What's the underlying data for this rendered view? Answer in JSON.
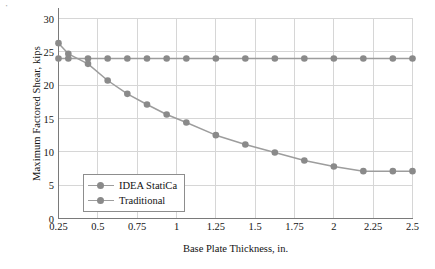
{
  "figure": {
    "corner_mark": "⋅"
  },
  "chart_data": {
    "type": "line",
    "title": "",
    "xlabel": "Base Plate Thickness, in.",
    "ylabel": "Maximum Factored Shear, kips",
    "xlim": [
      0.25,
      2.5
    ],
    "ylim": [
      0,
      30
    ],
    "xticks": [
      "0.25",
      "0.5",
      "0.75",
      "1",
      "1.25",
      "1.5",
      "1.75",
      "2",
      "2.25",
      "2.5"
    ],
    "xtick_values": [
      0.25,
      0.5,
      0.75,
      1,
      1.25,
      1.5,
      1.75,
      2,
      2.25,
      2.5
    ],
    "yticks": [
      "0",
      "5",
      "10",
      "15",
      "20",
      "25",
      "30"
    ],
    "ytick_values": [
      0,
      5,
      10,
      15,
      20,
      25,
      30
    ],
    "grid": true,
    "legend_position": "lower left",
    "marker": "circle",
    "line_color": "#9d9d9d",
    "marker_color": "#8a8a8a",
    "grid_color": "#d6d6d6",
    "axis_color": "#7a7a7a",
    "series": [
      {
        "name": "IDEA StatiCa",
        "x": [
          0.25,
          0.3125,
          0.4375,
          0.5625,
          0.6875,
          0.8125,
          0.9375,
          1.0625,
          1.25,
          1.4375,
          1.625,
          1.8125,
          2.0,
          2.1875,
          2.375,
          2.5
        ],
        "values": [
          26.3,
          24.7,
          23.2,
          20.7,
          18.7,
          17.1,
          15.6,
          14.4,
          12.5,
          11.1,
          9.9,
          8.7,
          7.8,
          7.1,
          7.1,
          7.1
        ]
      },
      {
        "name": "Traditional",
        "x": [
          0.25,
          0.3125,
          0.4375,
          0.5625,
          0.6875,
          0.8125,
          0.9375,
          1.0625,
          1.25,
          1.4375,
          1.625,
          1.8125,
          2.0,
          2.1875,
          2.375,
          2.5
        ],
        "values": [
          24.0,
          24.0,
          24.0,
          24.0,
          24.0,
          24.0,
          24.0,
          24.0,
          24.0,
          24.0,
          24.0,
          24.0,
          24.0,
          24.0,
          24.0,
          24.0
        ]
      }
    ]
  },
  "legend": {
    "items": [
      {
        "label": "IDEA StatiCa"
      },
      {
        "label": "Traditional"
      }
    ]
  }
}
